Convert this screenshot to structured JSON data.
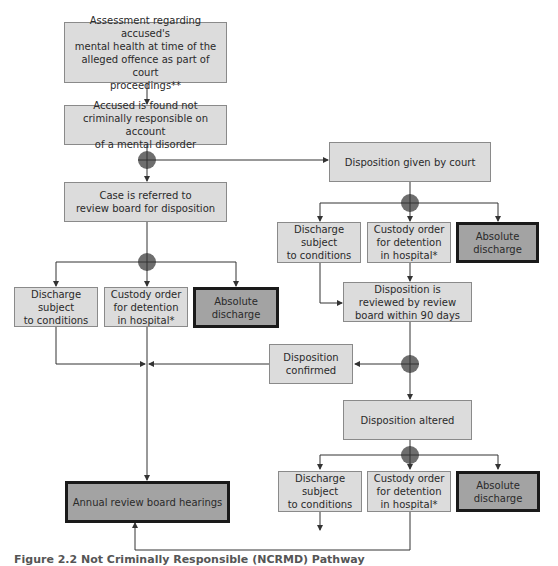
{
  "colors": {
    "box_fill": "#dcdcdc",
    "box_border": "#8a8a8a",
    "terminal_fill": "#a3a3a3",
    "terminal_border": "#1a1a1a",
    "junction": "#6e6e6e",
    "line": "#333333"
  },
  "nodes": {
    "assessment": "Assessment regarding accused's\nmental health at time of the\nalleged offence as part of court\nproceedings**",
    "ncr_finding": "Accused is found not\ncriminally responsible on account\nof a mental disorder",
    "referred_review_board": "Case is referred to\nreview board for disposition",
    "left_discharge_conditions": "Discharge subject\nto conditions",
    "left_custody_order": "Custody order\nfor detention\nin hospital*",
    "left_absolute_discharge": "Absolute\ndischarge",
    "annual_review": "Annual review board hearings",
    "disposition_court": "Disposition given by court",
    "right_discharge_conditions": "Discharge subject\nto conditions",
    "right_custody_order": "Custody order\nfor detention\nin hospital*",
    "right_absolute_discharge": "Absolute\ndischarge",
    "reviewed_90_days": "Disposition is\nreviewed by review\nboard within 90 days",
    "disposition_confirmed": "Disposition\nconfirmed",
    "disposition_altered": "Disposition altered",
    "bottom_discharge_conditions": "Discharge subject\nto conditions",
    "bottom_custody_order": "Custody order\nfor detention\nin hospital*",
    "bottom_absolute_discharge": "Absolute\ndischarge"
  },
  "caption": "Figure 2.2  Not Criminally Responsible (NCRMD) Pathway"
}
